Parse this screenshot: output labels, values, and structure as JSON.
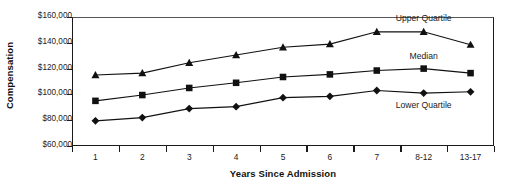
{
  "chart_data": {
    "type": "line",
    "title": "",
    "xlabel": "Years Since Admission",
    "ylabel": "Compensation",
    "ylim": [
      60000,
      160000
    ],
    "ytick_values": [
      160000,
      140000,
      120000,
      100000,
      80000,
      60000
    ],
    "ytick_labels": [
      "$160,000",
      "$140,000",
      "$120,000",
      "$100,000",
      "$80,000",
      "$60,000"
    ],
    "categories": [
      "1",
      "2",
      "3",
      "4",
      "5",
      "6",
      "7",
      "8-12",
      "13-17"
    ],
    "grid": false,
    "legend_position": "inline-annotations",
    "series": [
      {
        "name": "Upper Quartile",
        "marker": "triangle",
        "values": [
          115000,
          116500,
          124500,
          130500,
          136500,
          139000,
          148500,
          148500,
          138500
        ]
      },
      {
        "name": "Median",
        "marker": "square",
        "values": [
          95000,
          99500,
          105000,
          109000,
          113500,
          115500,
          118500,
          120000,
          116500
        ]
      },
      {
        "name": "Lower Quartile",
        "marker": "diamond",
        "values": [
          79500,
          82000,
          89000,
          90500,
          97500,
          98500,
          103000,
          101000,
          102000
        ]
      }
    ],
    "annotations": [
      {
        "text": "Upper Quartile",
        "series": "Upper Quartile"
      },
      {
        "text": "Median",
        "series": "Median"
      },
      {
        "text": "Lower Quartile",
        "series": "Lower Quartile"
      }
    ]
  }
}
